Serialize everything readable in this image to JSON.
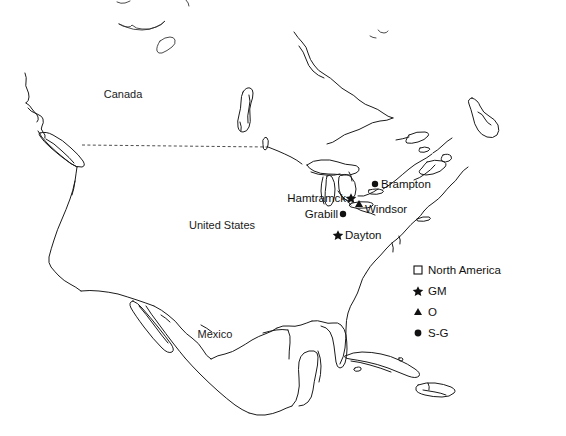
{
  "figure": {
    "type": "map",
    "projection_region": "North America",
    "background_color": "#ffffff",
    "line_color": "#1b1b1b"
  },
  "regions": [
    {
      "name": "canada",
      "label": "Canada",
      "x": 123,
      "y": 98
    },
    {
      "name": "united-states",
      "label": "United States",
      "x": 222,
      "y": 229
    },
    {
      "name": "mexico",
      "label": "Mexico",
      "x": 215,
      "y": 338
    }
  ],
  "cities": [
    {
      "name": "brampton",
      "label": "Brampton",
      "marker": "circle",
      "marker_meaning": "S-G",
      "marker_x": 375,
      "marker_y": 184,
      "label_x": 381,
      "label_y": 188,
      "label_anchor": "start"
    },
    {
      "name": "hamtramck",
      "label": "Hamtramck",
      "marker": "star",
      "marker_meaning": "GM",
      "marker_x": 351,
      "marker_y": 198,
      "label_x": 346,
      "label_y": 202,
      "label_anchor": "end"
    },
    {
      "name": "windsor",
      "label": "Windsor",
      "marker": "triangle",
      "marker_meaning": "O",
      "marker_x": 359,
      "marker_y": 204,
      "label_x": 365,
      "label_y": 213,
      "label_anchor": "start"
    },
    {
      "name": "grabill",
      "label": "Grabill",
      "marker": "circle",
      "marker_meaning": "S-G",
      "marker_x": 343,
      "marker_y": 214,
      "label_x": 338,
      "label_y": 218,
      "label_anchor": "end"
    },
    {
      "name": "dayton",
      "label": "Dayton",
      "marker": "star",
      "marker_meaning": "GM",
      "marker_x": 338,
      "marker_y": 235,
      "label_x": 345,
      "label_y": 239,
      "label_anchor": "start"
    }
  ],
  "legend": {
    "x": 414,
    "y": 266,
    "row_spacing": 21,
    "entries": [
      {
        "name": "north-america",
        "symbol": "square-open",
        "label": "North America"
      },
      {
        "name": "gm",
        "symbol": "star",
        "label": "GM"
      },
      {
        "name": "o",
        "symbol": "triangle",
        "label": "O"
      },
      {
        "name": "s-g",
        "symbol": "circle",
        "label": "S-G"
      }
    ]
  },
  "borders": {
    "canada_us_49th_parallel": {
      "name": "canada-us-border",
      "style": "dashed",
      "x1": 82,
      "y1": 145,
      "x2": 268,
      "y2": 147
    }
  }
}
